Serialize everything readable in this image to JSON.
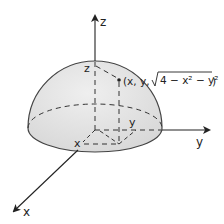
{
  "diagram": {
    "type": "3d-hemisphere",
    "axes": {
      "z_label": "z",
      "y_label": "y",
      "x_label": "x"
    },
    "point": {
      "label_prefix": "(x, y, ",
      "radical": "4 − x² − y²",
      "label_suffix": ")"
    },
    "component_labels": {
      "z": "z",
      "x": "x",
      "y": "y"
    },
    "colors": {
      "surface_fill": "#e3e3e3",
      "stroke": "#333333",
      "background": "#ffffff"
    }
  }
}
